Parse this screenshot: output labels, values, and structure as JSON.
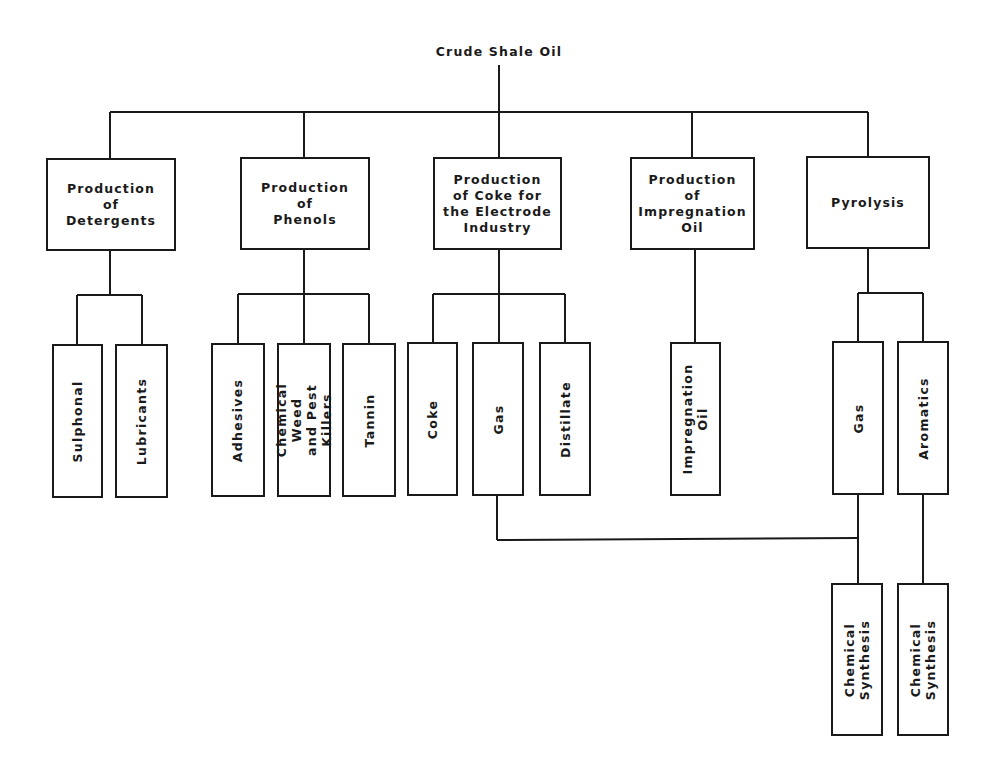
{
  "diagram": {
    "root": "Crude Shale Oil",
    "processes": [
      {
        "id": "detergents",
        "label": "Production\nof\nDetergents",
        "products": [
          "Sulphonal",
          "Lubricants"
        ]
      },
      {
        "id": "phenols",
        "label": "Production\nof\nPhenols",
        "products": [
          "Adhesives",
          "Chemical Weed\nand Pest Killers",
          "Tannin"
        ]
      },
      {
        "id": "coke",
        "label": "Production\nof Coke for\nthe Electrode\nIndustry",
        "products": [
          "Coke",
          "Gas",
          "Distillate"
        ]
      },
      {
        "id": "impregnation",
        "label": "Production\nof\nImpregnation\nOil",
        "products": [
          "Impregnation\nOil"
        ]
      },
      {
        "id": "pyrolysis",
        "label": "Pyrolysis",
        "products": [
          "Gas",
          "Aromatics"
        ]
      }
    ],
    "downstream": [
      {
        "label": "Chemical\nSynthesis",
        "from": [
          "Gas (Coke production)",
          "Gas (Pyrolysis)"
        ]
      },
      {
        "label": "Chemical\nSynthesis",
        "from": [
          "Aromatics"
        ]
      }
    ],
    "line_color": "#1a1a1a"
  }
}
